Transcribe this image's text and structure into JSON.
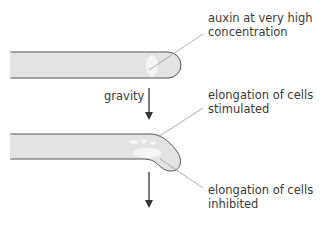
{
  "diagram": {
    "labels": {
      "auxin": {
        "line1": "auxin at very high",
        "line2": "concentration"
      },
      "gravity": "gravity",
      "stimulated": {
        "line1": "elongation of cells",
        "line2": "stimulated"
      },
      "inhibited": {
        "line1": "elongation of cells",
        "line2": "inhibited"
      }
    },
    "colors": {
      "root_fill": "#e3e3e3",
      "root_outline": "#555555",
      "auxin_patch": "#f6f6f6",
      "leader_line": "#9a9a9a",
      "arrow": "#333333",
      "text": "#3a3a3a"
    }
  }
}
